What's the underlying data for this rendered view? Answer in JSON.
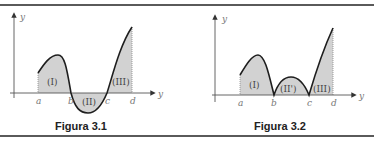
{
  "figures": [
    {
      "caption": "Figura 3.1",
      "y_axis_label": "y",
      "x_axis_label": "y",
      "ticks": [
        "a",
        "b",
        "c",
        "d"
      ],
      "regions": [
        "(I)",
        "(II)",
        "(III)"
      ]
    },
    {
      "caption": "Figura 3.2",
      "y_axis_label": "y",
      "x_axis_label": "y",
      "ticks": [
        "a",
        "b",
        "c",
        "d"
      ],
      "regions": [
        "(I)",
        "(II')",
        "(III)"
      ]
    }
  ],
  "colors": {
    "fill": "#d2d2d2",
    "curve": "#1e1e1e",
    "axis": "#555555",
    "rule": "#5a5a5a"
  }
}
